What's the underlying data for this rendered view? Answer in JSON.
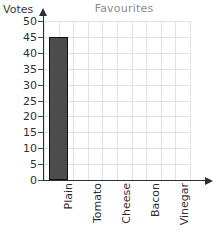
{
  "chart_data": {
    "type": "bar",
    "title": "Favourites",
    "xlabel": "",
    "ylabel": "Votes",
    "categories": [
      "Plain",
      "Tomato",
      "Cheese",
      "Bacon",
      "Vinegar"
    ],
    "values": [
      45,
      0,
      0,
      0,
      0
    ],
    "ylim": [
      0,
      50
    ],
    "ytick_step": 5,
    "yticks": [
      0,
      5,
      10,
      15,
      20,
      25,
      30,
      35,
      40,
      45,
      50
    ],
    "ytick_labels": [
      "0",
      "5",
      "10",
      "15",
      "20",
      "25",
      "30",
      "35",
      "40",
      "45",
      "50"
    ],
    "grid": true,
    "legend": false,
    "series": [
      {
        "name": "Votes",
        "values": [
          45,
          0,
          0,
          0,
          0
        ]
      }
    ],
    "colors": {
      "bar_fill": "#4c4c4c",
      "bar_border": "#111111",
      "grid": "#e2e2e2",
      "axis": "#2f2f2f",
      "title_text": "#8c8c8c",
      "tick_text": "#2f2f2f",
      "background": "#ffffff"
    }
  },
  "axis": {
    "y_name": "Votes",
    "x_name": ""
  },
  "title": {
    "text": "Favourites"
  }
}
